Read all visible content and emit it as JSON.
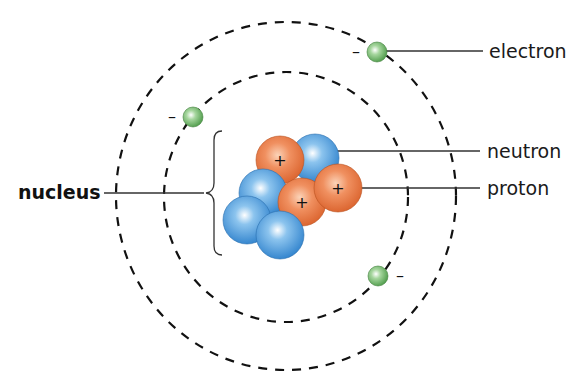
{
  "diagram": {
    "labels": {
      "electron": "electron",
      "neutron": "neutron",
      "proton": "proton",
      "nucleus": "nucleus"
    },
    "charges": {
      "proton": "+",
      "electron": "–"
    },
    "colors": {
      "proton": "#e8703a",
      "neutron": "#3a8fd6",
      "electron": "#6fb86a",
      "orbit": "#111111",
      "leader_line": "#333333"
    },
    "orbits": [
      {
        "name": "inner-orbit",
        "cx": 286,
        "cy": 197,
        "rx": 122,
        "ry": 125
      },
      {
        "name": "outer-orbit",
        "cx": 286,
        "cy": 196,
        "rx": 170,
        "ry": 174
      }
    ],
    "electrons": [
      {
        "x": 377,
        "y": 52
      },
      {
        "x": 193,
        "y": 117
      },
      {
        "x": 378,
        "y": 276
      }
    ],
    "nucleus_particles": [
      {
        "type": "neutron",
        "x": 315,
        "y": 158
      },
      {
        "type": "proton",
        "x": 280,
        "y": 160
      },
      {
        "type": "neutron",
        "x": 263,
        "y": 193
      },
      {
        "type": "neutron",
        "x": 247,
        "y": 220
      },
      {
        "type": "proton",
        "x": 302,
        "y": 202
      },
      {
        "type": "proton",
        "x": 338,
        "y": 188
      },
      {
        "type": "neutron",
        "x": 280,
        "y": 235
      }
    ]
  }
}
